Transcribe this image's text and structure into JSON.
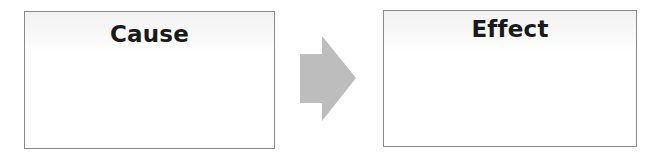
{
  "diagram": {
    "type": "cause-effect",
    "boxes": [
      {
        "id": "cause",
        "title": "Cause",
        "content": ""
      },
      {
        "id": "effect",
        "title": "Effect",
        "content": ""
      }
    ],
    "connector": {
      "from": "cause",
      "to": "effect",
      "icon": "right-arrow-icon",
      "color": "#bdbdbd"
    },
    "colors": {
      "box_border": "#8a8a8a",
      "title_text": "#1a1a1a",
      "background": "#ffffff"
    }
  }
}
